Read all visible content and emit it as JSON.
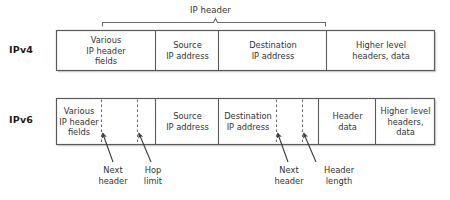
{
  "diagram": {
    "brace": {
      "caption": "IP header"
    },
    "rows": [
      {
        "id": "ipv4",
        "label": "IPv4",
        "fields": [
          {
            "name": "various-ip-header-fields",
            "text": "Various\nIP header\nfields"
          },
          {
            "name": "source-ip-address",
            "text": "Source\nIP address"
          },
          {
            "name": "destination-ip-address",
            "text": "Destination\nIP address"
          },
          {
            "name": "higher-level-headers-data",
            "text": "Higher level\nheaders, data"
          }
        ]
      },
      {
        "id": "ipv6",
        "label": "IPv6",
        "fields": [
          {
            "name": "various-ip-header-fields",
            "text": "Various\nIP header\nfields"
          },
          {
            "name": "source-ip-address",
            "text": "Source\nIP address"
          },
          {
            "name": "destination-ip-address",
            "text": "Destination\nIP address"
          },
          {
            "name": "header-data",
            "text": "Header\ndata"
          },
          {
            "name": "higher-level-headers-data",
            "text": "Higher level\nheaders,\ndata"
          }
        ]
      }
    ],
    "callouts": [
      {
        "name": "next-header-1",
        "text": "Next\nheader"
      },
      {
        "name": "hop-limit",
        "text": "Hop\nlimit"
      },
      {
        "name": "next-header-2",
        "text": "Next\nheader"
      },
      {
        "name": "header-length",
        "text": "Header\nlength"
      }
    ],
    "colors": {
      "background": "#ffffff",
      "stroke": "#555555",
      "text": "#333333",
      "label_text": "#1c1c1c"
    }
  }
}
